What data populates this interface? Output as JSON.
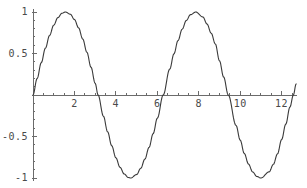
{
  "chart_data": {
    "type": "line",
    "title": "",
    "subtitle": "",
    "xlabel": "",
    "ylabel": "",
    "function": "sin(x)",
    "xlim": [
      0,
      12.7
    ],
    "ylim": [
      -1.05,
      1.05
    ],
    "grid": false,
    "legend": null,
    "legend_position": "none",
    "axis_style": "crossing-axes-at-origin",
    "line_color": "#3a3a3a",
    "axis_color": "#6b6b6b",
    "background_color": "#ffffff",
    "x_ticks": [
      {
        "value": 2,
        "label": "2"
      },
      {
        "value": 4,
        "label": "4"
      },
      {
        "value": 6,
        "label": "6"
      },
      {
        "value": 8,
        "label": "8"
      },
      {
        "value": 10,
        "label": "10"
      },
      {
        "value": 12,
        "label": "12"
      }
    ],
    "x_minor_ticks": [
      0.5,
      1,
      1.5,
      2.5,
      3,
      3.5,
      4.5,
      5,
      5.5,
      6.5,
      7,
      7.5,
      8.5,
      9,
      9.5,
      10.5,
      11,
      11.5,
      12.5
    ],
    "y_ticks": [
      {
        "value": 1,
        "label": "1"
      },
      {
        "value": 0.5,
        "label": "0.5"
      },
      {
        "value": -0.5,
        "label": "-0.5"
      },
      {
        "value": -1,
        "label": "-1"
      }
    ],
    "y_minor_ticks": [
      0.9,
      0.8,
      0.7,
      0.6,
      0.4,
      0.3,
      0.2,
      0.1,
      -0.1,
      -0.2,
      -0.3,
      -0.4,
      -0.6,
      -0.7,
      -0.8,
      -0.9
    ],
    "series": [
      {
        "name": "sin(x)",
        "x": [
          0,
          0.2,
          0.4,
          0.6,
          0.8,
          1,
          1.2,
          1.4,
          1.5708,
          1.8,
          2,
          2.2,
          2.4,
          2.6,
          2.8,
          3,
          3.1416,
          3.4,
          3.6,
          3.8,
          4,
          4.2,
          4.4,
          4.6,
          4.7124,
          5,
          5.2,
          5.4,
          5.6,
          5.8,
          6,
          6.2832,
          6.6,
          6.8,
          7,
          7.2,
          7.4,
          7.6,
          7.854,
          8.2,
          8.4,
          8.6,
          8.8,
          9,
          9.2,
          9.4248,
          9.8,
          10,
          10.2,
          10.4,
          10.6,
          10.8,
          10.9956,
          11.4,
          11.6,
          11.8,
          12,
          12.2,
          12.4,
          12.566,
          12.7
        ],
        "y": [
          0,
          0.1987,
          0.3894,
          0.5646,
          0.7174,
          0.8415,
          0.932,
          0.9854,
          1,
          0.9738,
          0.9093,
          0.8085,
          0.6755,
          0.5155,
          0.335,
          0.1411,
          0,
          -0.2555,
          -0.4425,
          -0.6119,
          -0.7568,
          -0.8716,
          -0.9516,
          -0.9937,
          -1,
          -0.9589,
          -0.8835,
          -0.7727,
          -0.6313,
          -0.4646,
          -0.2794,
          0,
          0.3115,
          0.4941,
          0.657,
          0.7937,
          0.8987,
          0.9679,
          1,
          0.9407,
          0.8546,
          0.7451,
          0.6154,
          0.4121,
          0.2167,
          -0.0,
          -0.3665,
          -0.544,
          -0.7055,
          -0.8323,
          -0.9268,
          -0.9809,
          -1,
          -0.9258,
          -0.8358,
          -0.7091,
          -0.5366,
          -0.3508,
          -0.1455,
          0,
          0.1332
        ]
      }
    ],
    "peaks": [
      {
        "x": 1.5708,
        "y": 1
      },
      {
        "x": 7.854,
        "y": 1
      }
    ],
    "troughs": [
      {
        "x": 4.7124,
        "y": -1
      },
      {
        "x": 10.9956,
        "y": -1
      }
    ],
    "zero_crossings": [
      0,
      3.1416,
      6.2832,
      9.4248,
      12.566
    ]
  }
}
